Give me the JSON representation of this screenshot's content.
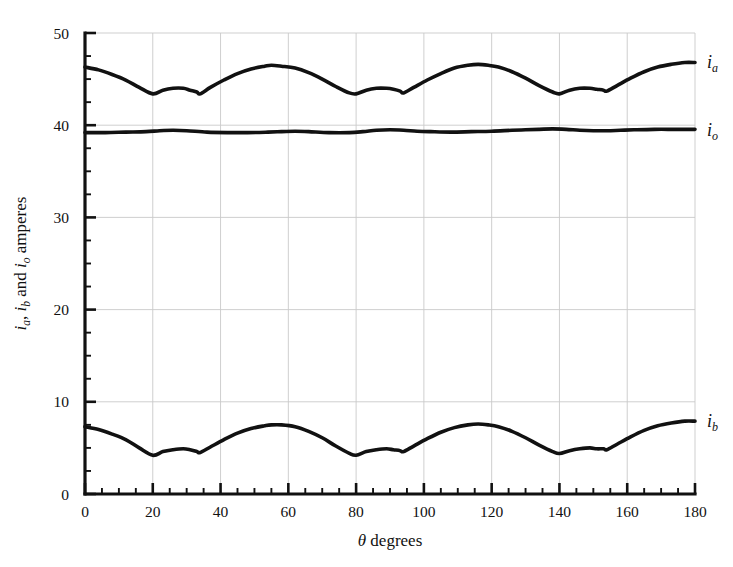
{
  "chart_data": {
    "type": "line",
    "title": "",
    "xlabel": "θ degrees",
    "ylabel": "i_a, i_b and i_o amperes",
    "xlabel_parts": {
      "symbol": "θ",
      "text": " degrees"
    },
    "ylabel_parts": [
      {
        "var": "i",
        "sub": "a",
        "text": ", "
      },
      {
        "var": "i",
        "sub": "b",
        "text": " and "
      },
      {
        "var": "i",
        "sub": "o",
        "text": " amperes"
      }
    ],
    "xlim": [
      0,
      180
    ],
    "ylim": [
      0,
      50
    ],
    "xticks": [
      0,
      20,
      40,
      60,
      80,
      100,
      120,
      140,
      160,
      180
    ],
    "xticklabels": [
      "0",
      "20",
      "40",
      "60",
      "80",
      "100",
      "120",
      "140",
      "160",
      "180"
    ],
    "yticks": [
      0,
      10,
      20,
      30,
      40,
      50
    ],
    "yticklabels": [
      "0",
      "10",
      "20",
      "30",
      "40",
      "50"
    ],
    "x_minor_step": 5,
    "y_minor_step": 2.5,
    "grid": true,
    "grid_color": "#c9c9c9",
    "line_color": "#111111",
    "background": "#ffffff",
    "legend_position": "right-inline",
    "series": [
      {
        "name": "i_a",
        "label_var": "i",
        "label_sub": "a",
        "label_x": 180,
        "label_y": 46.9,
        "x": [
          0,
          4,
          8,
          12,
          16,
          20,
          23,
          26,
          29,
          31,
          33,
          34,
          37,
          41,
          45,
          49,
          53,
          55,
          58,
          62,
          66,
          70,
          74,
          78,
          80,
          83,
          86,
          89,
          91,
          93,
          94,
          97,
          101,
          105,
          109,
          113,
          116,
          119,
          122,
          126,
          130,
          134,
          138,
          140,
          143,
          146,
          149,
          151,
          153,
          154,
          157,
          161,
          165,
          169,
          173,
          177,
          180
        ],
        "y": [
          46.3,
          46.0,
          45.5,
          44.9,
          44.1,
          43.4,
          43.8,
          44.0,
          44.0,
          43.8,
          43.6,
          43.4,
          44.1,
          44.9,
          45.6,
          46.1,
          46.4,
          46.5,
          46.4,
          46.2,
          45.7,
          45.0,
          44.2,
          43.5,
          43.4,
          43.8,
          44.0,
          44.0,
          43.9,
          43.7,
          43.5,
          44.1,
          44.9,
          45.6,
          46.2,
          46.5,
          46.6,
          46.5,
          46.3,
          45.8,
          45.1,
          44.3,
          43.6,
          43.4,
          43.8,
          44.0,
          44.0,
          43.9,
          43.8,
          43.7,
          44.3,
          45.1,
          45.8,
          46.3,
          46.6,
          46.8,
          46.8
        ]
      },
      {
        "name": "i_o",
        "label_var": "i",
        "label_sub": "o",
        "label_x": 180,
        "label_y": 39.5,
        "x": [
          0,
          6,
          12,
          18,
          22,
          26,
          30,
          36,
          42,
          48,
          54,
          58,
          62,
          66,
          72,
          78,
          82,
          86,
          90,
          94,
          98,
          102,
          108,
          114,
          120,
          126,
          130,
          134,
          138,
          142,
          146,
          150,
          154,
          158,
          162,
          168,
          174,
          180
        ],
        "y": [
          39.2,
          39.2,
          39.25,
          39.3,
          39.4,
          39.45,
          39.4,
          39.25,
          39.2,
          39.2,
          39.25,
          39.3,
          39.35,
          39.3,
          39.2,
          39.2,
          39.3,
          39.45,
          39.5,
          39.45,
          39.35,
          39.3,
          39.25,
          39.3,
          39.35,
          39.45,
          39.5,
          39.55,
          39.6,
          39.55,
          39.45,
          39.4,
          39.4,
          39.45,
          39.5,
          39.55,
          39.55,
          39.55
        ]
      },
      {
        "name": "i_b",
        "label_var": "i",
        "label_sub": "b",
        "label_x": 180,
        "label_y": 7.9,
        "x": [
          0,
          4,
          8,
          12,
          16,
          20,
          23,
          26,
          29,
          31,
          33,
          34,
          37,
          41,
          45,
          49,
          53,
          55,
          58,
          62,
          66,
          70,
          74,
          78,
          80,
          83,
          86,
          89,
          91,
          93,
          94,
          97,
          101,
          105,
          109,
          113,
          116,
          119,
          122,
          126,
          130,
          134,
          138,
          140,
          143,
          146,
          149,
          151,
          153,
          154,
          157,
          161,
          165,
          169,
          173,
          177,
          180
        ],
        "y": [
          7.3,
          7.0,
          6.5,
          5.9,
          5.0,
          4.2,
          4.6,
          4.8,
          4.9,
          4.8,
          4.6,
          4.5,
          5.1,
          5.9,
          6.6,
          7.1,
          7.4,
          7.5,
          7.5,
          7.3,
          6.8,
          6.1,
          5.2,
          4.4,
          4.2,
          4.6,
          4.8,
          4.9,
          4.8,
          4.7,
          4.6,
          5.2,
          6.0,
          6.7,
          7.2,
          7.5,
          7.6,
          7.5,
          7.3,
          6.8,
          6.1,
          5.3,
          4.6,
          4.4,
          4.7,
          4.9,
          5.0,
          4.9,
          4.9,
          4.8,
          5.4,
          6.2,
          6.9,
          7.4,
          7.7,
          7.9,
          7.9
        ]
      }
    ]
  },
  "plot": {
    "left_px": 85,
    "right_px": 695,
    "top_px": 33,
    "bottom_px": 494
  }
}
